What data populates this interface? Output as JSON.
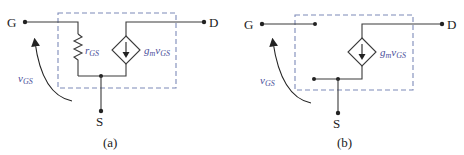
{
  "figure": {
    "panels": [
      {
        "id": "a",
        "caption": "(a)",
        "terminals": {
          "gate": "G",
          "drain": "D",
          "source": "S"
        },
        "resistor_label": {
          "base": "r",
          "sub": "GS"
        },
        "source_label": {
          "g": "g",
          "gsub": "m",
          "v": "v",
          "vsub": "GS"
        },
        "voltage_label": {
          "base": "v",
          "sub": "GS"
        }
      },
      {
        "id": "b",
        "caption": "(b)",
        "terminals": {
          "gate": "G",
          "drain": "D",
          "source": "S"
        },
        "source_label": {
          "g": "g",
          "gsub": "m",
          "v": "v",
          "vsub": "GS"
        },
        "voltage_label": {
          "base": "v",
          "sub": "GS"
        }
      }
    ],
    "colors": {
      "wire": "#3a3a3a",
      "dashed_box": "#7d8ab8",
      "symbol_text": "#4a4f9a",
      "label_text": "#222222"
    }
  }
}
